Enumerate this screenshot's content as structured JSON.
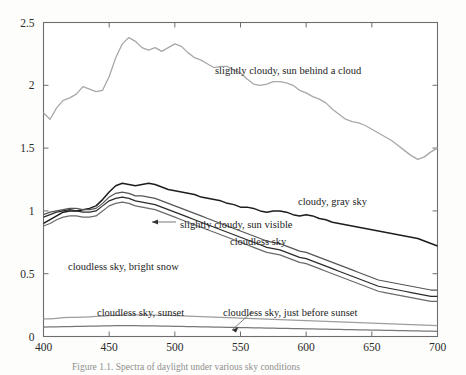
{
  "figure": {
    "background_color": "#fdfdfb",
    "frame_color": "#6e6e6e",
    "caption_text": "Figure 1.1.  Spectra of daylight under various sky conditions"
  },
  "chart_data": {
    "type": "line",
    "title": "",
    "subtitle": "",
    "xlabel": "",
    "ylabel": "",
    "xlim": [
      400,
      700
    ],
    "ylim": [
      0,
      2.5
    ],
    "grid": false,
    "legend_position": "inline-annotations",
    "xticks": [
      400,
      450,
      500,
      550,
      600,
      650,
      700
    ],
    "xtick_labels": [
      "400",
      "450",
      "500",
      "550",
      "600",
      "650",
      "700"
    ],
    "yticks": [
      0,
      0.5,
      1,
      1.5,
      2,
      2.5
    ],
    "ytick_labels": [
      "0",
      "0.5",
      "1",
      "1.5",
      "2",
      "2.5"
    ],
    "x": [
      400,
      405,
      410,
      415,
      420,
      425,
      430,
      435,
      440,
      445,
      450,
      455,
      460,
      465,
      470,
      475,
      480,
      485,
      490,
      495,
      500,
      505,
      510,
      515,
      520,
      525,
      530,
      535,
      540,
      545,
      550,
      555,
      560,
      565,
      570,
      575,
      580,
      585,
      590,
      595,
      600,
      605,
      610,
      615,
      620,
      625,
      630,
      635,
      640,
      645,
      650,
      655,
      660,
      665,
      670,
      675,
      680,
      685,
      690,
      695,
      700
    ],
    "series": [
      {
        "name": "slightly cloudy, sun behind a cloud",
        "color": "#a8a8a8",
        "width": 1.3,
        "values": [
          1.78,
          1.73,
          1.82,
          1.88,
          1.9,
          1.93,
          1.99,
          1.97,
          1.95,
          1.96,
          2.07,
          2.22,
          2.33,
          2.38,
          2.35,
          2.3,
          2.28,
          2.3,
          2.27,
          2.3,
          2.33,
          2.31,
          2.26,
          2.22,
          2.2,
          2.17,
          2.14,
          2.15,
          2.15,
          2.12,
          2.1,
          2.05,
          2.01,
          2.0,
          2.01,
          2.03,
          2.03,
          2.02,
          2.0,
          1.96,
          1.94,
          1.91,
          1.89,
          1.86,
          1.81,
          1.77,
          1.73,
          1.71,
          1.7,
          1.68,
          1.65,
          1.62,
          1.59,
          1.56,
          1.52,
          1.48,
          1.44,
          1.41,
          1.43,
          1.47,
          1.5
        ]
      },
      {
        "name": "cloudy, gray sky",
        "color": "#1d1d1d",
        "width": 1.5,
        "values": [
          0.9,
          0.93,
          0.96,
          0.99,
          1.0,
          1.0,
          1.01,
          1.02,
          1.04,
          1.09,
          1.15,
          1.2,
          1.22,
          1.21,
          1.2,
          1.21,
          1.22,
          1.21,
          1.19,
          1.17,
          1.16,
          1.15,
          1.14,
          1.13,
          1.11,
          1.1,
          1.09,
          1.08,
          1.06,
          1.05,
          1.03,
          1.03,
          1.02,
          1.0,
          0.99,
          1.0,
          1.0,
          0.99,
          0.97,
          0.96,
          0.97,
          0.96,
          0.94,
          0.93,
          0.91,
          0.9,
          0.89,
          0.88,
          0.87,
          0.86,
          0.85,
          0.84,
          0.83,
          0.82,
          0.81,
          0.8,
          0.79,
          0.78,
          0.76,
          0.74,
          0.72
        ]
      },
      {
        "name": "slightly cloudy, sun visible",
        "color": "#555555",
        "width": 1.2,
        "values": [
          0.97,
          0.99,
          1.0,
          1.01,
          1.02,
          1.02,
          1.01,
          1.01,
          1.02,
          1.06,
          1.11,
          1.14,
          1.15,
          1.14,
          1.12,
          1.12,
          1.11,
          1.1,
          1.08,
          1.06,
          1.04,
          1.02,
          1.0,
          0.98,
          0.96,
          0.94,
          0.92,
          0.9,
          0.88,
          0.86,
          0.84,
          0.82,
          0.8,
          0.78,
          0.76,
          0.75,
          0.74,
          0.72,
          0.7,
          0.68,
          0.67,
          0.65,
          0.63,
          0.61,
          0.59,
          0.57,
          0.55,
          0.53,
          0.51,
          0.49,
          0.47,
          0.45,
          0.44,
          0.43,
          0.42,
          0.41,
          0.4,
          0.39,
          0.38,
          0.37,
          0.37
        ]
      },
      {
        "name": "cloudless sky",
        "color": "#2b2b2b",
        "width": 1.2,
        "values": [
          0.95,
          0.97,
          0.99,
          1.0,
          1.01,
          1.0,
          0.99,
          0.99,
          1.0,
          1.04,
          1.08,
          1.1,
          1.11,
          1.1,
          1.08,
          1.07,
          1.06,
          1.05,
          1.03,
          1.01,
          0.99,
          0.97,
          0.95,
          0.93,
          0.91,
          0.89,
          0.87,
          0.85,
          0.83,
          0.81,
          0.79,
          0.77,
          0.75,
          0.73,
          0.71,
          0.7,
          0.69,
          0.67,
          0.65,
          0.63,
          0.62,
          0.6,
          0.58,
          0.56,
          0.54,
          0.52,
          0.5,
          0.48,
          0.46,
          0.44,
          0.42,
          0.4,
          0.39,
          0.38,
          0.37,
          0.36,
          0.35,
          0.34,
          0.33,
          0.32,
          0.32
        ]
      },
      {
        "name": "cloudless sky, bright snow",
        "color": "#6a6a6a",
        "width": 1.2,
        "values": [
          0.88,
          0.9,
          0.93,
          0.95,
          0.96,
          0.96,
          0.95,
          0.95,
          0.96,
          1.0,
          1.04,
          1.06,
          1.07,
          1.06,
          1.04,
          1.03,
          1.02,
          1.01,
          0.99,
          0.97,
          0.95,
          0.93,
          0.91,
          0.89,
          0.87,
          0.85,
          0.83,
          0.81,
          0.79,
          0.77,
          0.75,
          0.73,
          0.71,
          0.69,
          0.67,
          0.66,
          0.65,
          0.63,
          0.61,
          0.59,
          0.58,
          0.56,
          0.54,
          0.52,
          0.5,
          0.48,
          0.46,
          0.44,
          0.42,
          0.4,
          0.38,
          0.36,
          0.35,
          0.34,
          0.33,
          0.32,
          0.31,
          0.3,
          0.29,
          0.28,
          0.28
        ]
      },
      {
        "name": "cloudless sky, sunset",
        "color": "#9d9d9d",
        "width": 1.2,
        "values": [
          0.14,
          0.14,
          0.145,
          0.15,
          0.152,
          0.153,
          0.155,
          0.157,
          0.16,
          0.163,
          0.166,
          0.168,
          0.17,
          0.171,
          0.172,
          0.172,
          0.171,
          0.17,
          0.169,
          0.168,
          0.166,
          0.164,
          0.162,
          0.16,
          0.158,
          0.156,
          0.154,
          0.152,
          0.15,
          0.148,
          0.146,
          0.144,
          0.142,
          0.14,
          0.138,
          0.136,
          0.134,
          0.132,
          0.13,
          0.128,
          0.126,
          0.124,
          0.122,
          0.12,
          0.118,
          0.116,
          0.114,
          0.112,
          0.11,
          0.108,
          0.106,
          0.104,
          0.102,
          0.1,
          0.098,
          0.096,
          0.094,
          0.092,
          0.09,
          0.088,
          0.086
        ]
      },
      {
        "name": "cloudless sky, just before sunset",
        "color": "#777777",
        "width": 1.2,
        "values": [
          0.075,
          0.076,
          0.077,
          0.078,
          0.079,
          0.08,
          0.081,
          0.082,
          0.083,
          0.084,
          0.085,
          0.086,
          0.086,
          0.086,
          0.086,
          0.085,
          0.085,
          0.084,
          0.083,
          0.082,
          0.081,
          0.08,
          0.079,
          0.078,
          0.077,
          0.076,
          0.075,
          0.074,
          0.073,
          0.072,
          0.071,
          0.07,
          0.069,
          0.068,
          0.067,
          0.066,
          0.065,
          0.064,
          0.063,
          0.062,
          0.061,
          0.06,
          0.059,
          0.058,
          0.057,
          0.056,
          0.055,
          0.054,
          0.053,
          0.052,
          0.051,
          0.05,
          0.049,
          0.048,
          0.047,
          0.046,
          0.045,
          0.044,
          0.043,
          0.042,
          0.041
        ]
      }
    ],
    "annotations": [
      {
        "id": "ann-sun-behind-cloud",
        "text": "slightly cloudy, sun behind a cloud",
        "x": 215,
        "y": 65
      },
      {
        "id": "ann-cloudy-gray-sky",
        "text": "cloudy, gray sky",
        "x": 298,
        "y": 196
      },
      {
        "id": "ann-sun-visible",
        "text": "slightly cloudy, sun visible",
        "x": 180,
        "y": 219
      },
      {
        "id": "ann-cloudless-sky",
        "text": "cloudless sky",
        "x": 230,
        "y": 236
      },
      {
        "id": "ann-bright-snow",
        "text": "cloudless sky, bright snow",
        "x": 68,
        "y": 261
      },
      {
        "id": "ann-sunset",
        "text": "cloudless sky, sunset",
        "x": 97,
        "y": 307
      },
      {
        "id": "ann-just-before-sunset",
        "text": "cloudless sky, just before sunset",
        "x": 223,
        "y": 307
      }
    ]
  }
}
